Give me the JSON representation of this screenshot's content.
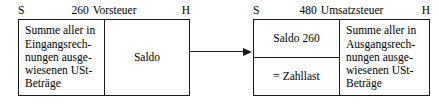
{
  "diagram": {
    "title_hidden": "",
    "accounts": [
      {
        "id": "vorsteuer",
        "number": "260",
        "name": "Vorsteuer",
        "debit_label": "S",
        "credit_label": "H",
        "debit_cells": [
          {
            "text": "Summe aller in\nEingangsrech-\nnungen ausge-\nwiesenen USt-\nBeträge",
            "align": "left"
          }
        ],
        "credit_cells": [
          {
            "text": "Saldo",
            "align": "center"
          }
        ]
      },
      {
        "id": "umsatzsteuer",
        "number": "480",
        "name": "Umsatzsteuer",
        "debit_label": "S",
        "credit_label": "H",
        "debit_cells": [
          {
            "text": "Saldo  260",
            "align": "center"
          },
          {
            "text": "= Zahllast",
            "align": "center"
          }
        ],
        "credit_cells": [
          {
            "text": "Summe aller in\nAusgangsrech-\nnungen ausge-\nwiesenen USt-\nBeträge",
            "align": "left"
          }
        ]
      }
    ],
    "connector": {
      "name": "saldo-transfer-arrow",
      "direction": "right"
    },
    "colors": {
      "line": "#1a1a1a",
      "background": "#ffffff",
      "text": "#000000"
    }
  }
}
